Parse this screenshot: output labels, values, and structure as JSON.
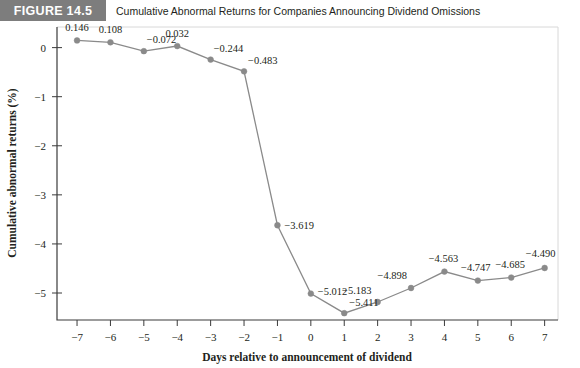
{
  "header": {
    "badge_label": "FIGURE 14.5",
    "caption": "Cumulative Abnormal Returns for Companies Announcing Dividend Omissions",
    "badge_color": "#7d7d7d"
  },
  "chart_data": {
    "type": "line",
    "title": "Cumulative Abnormal Returns for Companies Announcing Dividend Omissions",
    "xlabel": "Days relative to announcement of dividend",
    "ylabel": "Cumulative abnormal returns (%)",
    "x": [
      -7,
      -6,
      -5,
      -4,
      -3,
      -2,
      -1,
      0,
      1,
      2,
      3,
      4,
      5,
      6,
      7
    ],
    "values": [
      0.146,
      0.108,
      -0.072,
      0.032,
      -0.244,
      -0.483,
      -3.619,
      -5.012,
      -5.411,
      -5.183,
      -4.898,
      -4.563,
      -4.747,
      -4.685,
      -4.49
    ],
    "point_labels": [
      "0.146",
      "0.108",
      "−0.072",
      "0.032",
      "−0.244",
      "−0.483",
      "−3.619",
      "−5.012",
      "−5.411",
      "−5.183",
      "−4.898",
      "−4.563",
      "−4.747",
      "−4.685",
      "−4.490"
    ],
    "xtick_labels": [
      "−7",
      "−6",
      "−5",
      "−4",
      "−3",
      "−2",
      "−1",
      "0",
      "1",
      "2",
      "3",
      "4",
      "5",
      "6",
      "7"
    ],
    "ytick_values": [
      0,
      -1,
      -2,
      -3,
      -4,
      -5
    ],
    "ytick_labels": [
      "0",
      "−1",
      "−2",
      "−3",
      "−4",
      "−5"
    ],
    "xlim": [
      -7.6,
      7.4
    ],
    "ylim": [
      -5.55,
      0.42
    ],
    "grid": false,
    "legend": null,
    "series_color": "#8a8a8a",
    "marker": "circle"
  }
}
